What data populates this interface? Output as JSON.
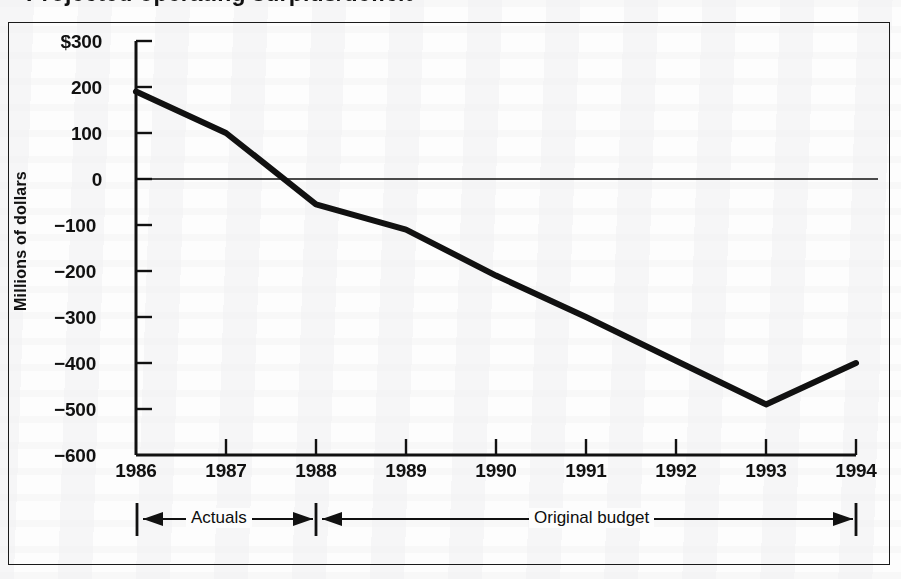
{
  "document": {
    "title_clipped": "Projected operating surplus/deficit",
    "background_color": "#fdfdfd",
    "ink_color": "#111111"
  },
  "chart_data": {
    "type": "line",
    "title": "",
    "xlabel": "",
    "ylabel": "Millions of dollars",
    "x": [
      1986,
      1987,
      1988,
      1989,
      1990,
      1991,
      1992,
      1993,
      1994
    ],
    "categories": [
      "1986",
      "1987",
      "1988",
      "1989",
      "1990",
      "1991",
      "1992",
      "1993",
      "1994"
    ],
    "values": [
      190,
      100,
      -55,
      -110,
      -210,
      -300,
      -395,
      -490,
      -400
    ],
    "series": [
      {
        "name": "Operating surplus/deficit",
        "values": [
          190,
          100,
          -55,
          -110,
          -210,
          -300,
          -395,
          -490,
          -400
        ]
      }
    ],
    "ylim": [
      -600,
      300
    ],
    "xlim": [
      1986,
      1994
    ],
    "yticks": [
      300,
      200,
      100,
      0,
      -100,
      -200,
      -300,
      -400,
      -500,
      -600
    ],
    "ytick_labels": [
      "$300",
      "200",
      "100",
      "0",
      "−100",
      "−200",
      "−300",
      "−400",
      "−500",
      "−600"
    ],
    "xtick_labels": [
      "1986",
      "1987",
      "1988",
      "1989",
      "1990",
      "1991",
      "1992",
      "1993",
      "1994"
    ],
    "grid": false,
    "legend": "none",
    "zero_line": 0,
    "line_color": "#111111",
    "line_width": 6,
    "annotations": [
      {
        "label": "Actuals",
        "type": "range-bracket",
        "from": "1986",
        "to": "1988",
        "arrows": "both"
      },
      {
        "label": "Original budget",
        "type": "range-bracket",
        "from": "1988",
        "to": "1994",
        "arrows": "both"
      }
    ]
  },
  "axis": {
    "y_title": "Millions of dollars",
    "y_labels": [
      "$300",
      "200",
      "100",
      "0",
      "−100",
      "−200",
      "−300",
      "−400",
      "−500",
      "−600"
    ],
    "x_labels": [
      "1986",
      "1987",
      "1988",
      "1989",
      "1990",
      "1991",
      "1992",
      "1993",
      "1994"
    ]
  },
  "brackets": {
    "actuals_label": "Actuals",
    "original_budget_label": "Original budget"
  }
}
